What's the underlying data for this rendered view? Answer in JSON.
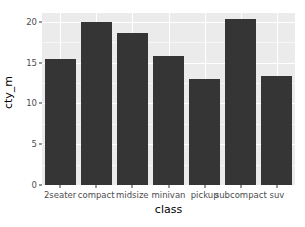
{
  "chart_data": {
    "type": "bar",
    "title": "",
    "xlabel": "class",
    "ylabel": "cty_m",
    "categories": [
      "2seater",
      "compact",
      "midsize",
      "minivan",
      "pickup",
      "subcompact",
      "suv"
    ],
    "values": [
      15.4,
      20.0,
      18.7,
      15.8,
      13.0,
      20.4,
      13.4
    ],
    "ylim": [
      0,
      21.1
    ],
    "y_ticks": [
      0,
      5,
      10,
      15,
      20
    ],
    "y_tick_labels": [
      "0",
      "5",
      "10",
      "15",
      "20"
    ],
    "grid": true,
    "legend": "none",
    "colors": {
      "bar": "#353535",
      "panel_background": "#ebebeb",
      "grid_major": "#ffffff",
      "grid_minor": "#f7f7f7",
      "axis_text": "#4d4d4d",
      "axis_title": "#000000",
      "plot_background": "#ffffff"
    }
  }
}
